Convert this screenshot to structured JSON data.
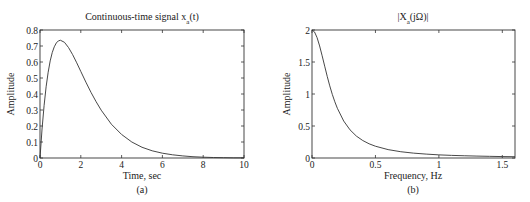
{
  "chart_data": [
    {
      "type": "line",
      "panel": "(a)",
      "title": "Continuous-time signal x_a(t)",
      "title_main": "Continuous-time signal x",
      "title_sub": "a",
      "title_tail": "(t)",
      "xlabel": "Time, sec",
      "ylabel": "Amplitude",
      "caption": "(a)",
      "xlim": [
        0,
        10
      ],
      "ylim": [
        0,
        0.8
      ],
      "xticks": [
        0,
        2,
        4,
        6,
        8,
        10
      ],
      "xtick_labels": [
        "0",
        "2",
        "4",
        "6",
        "8",
        "10"
      ],
      "yticks": [
        0,
        0.1,
        0.2,
        0.3,
        0.4,
        0.5,
        0.6,
        0.7,
        0.8
      ],
      "ytick_labels": [
        "0",
        "0.1",
        "0.2",
        "0.3",
        "0.4",
        "0.5",
        "0.6",
        "0.7",
        "0.8"
      ],
      "grid": false,
      "series": [
        {
          "name": "x_a(t)",
          "x": [
            0,
            0.1,
            0.2,
            0.3,
            0.4,
            0.5,
            0.6,
            0.7,
            0.8,
            0.9,
            1.0,
            1.2,
            1.4,
            1.6,
            1.8,
            2.0,
            2.25,
            2.5,
            2.75,
            3.0,
            3.5,
            4.0,
            4.5,
            5.0,
            5.5,
            6.0,
            6.5,
            7.0,
            7.5,
            8.0,
            8.5,
            9.0,
            9.5,
            10.0
          ],
          "y": [
            0,
            0.181,
            0.327,
            0.445,
            0.536,
            0.607,
            0.659,
            0.695,
            0.719,
            0.732,
            0.736,
            0.723,
            0.69,
            0.646,
            0.595,
            0.541,
            0.474,
            0.41,
            0.352,
            0.299,
            0.211,
            0.147,
            0.1,
            0.067,
            0.045,
            0.03,
            0.02,
            0.013,
            0.008,
            0.005,
            0.003,
            0.002,
            0.001,
            0.001
          ]
        }
      ]
    },
    {
      "type": "line",
      "panel": "(b)",
      "title": "|X_a(jΩ)|",
      "title_main": "|X",
      "title_sub": "a",
      "title_tail": "(jΩ)|",
      "xlabel": "Frequency, Hz",
      "ylabel": "Amplitude",
      "caption": "(b)",
      "xlim": [
        0,
        1.6
      ],
      "ylim": [
        0,
        2
      ],
      "xticks": [
        0,
        0.5,
        1,
        1.5
      ],
      "xtick_labels": [
        "0",
        "0.5",
        "1",
        "1.5"
      ],
      "yticks": [
        0,
        0.5,
        1,
        1.5,
        2
      ],
      "ytick_labels": [
        "0",
        "0.5",
        "1",
        "1.5",
        "2"
      ],
      "grid": false,
      "series": [
        {
          "name": "|X_a(jΩ)|",
          "x": [
            0,
            0.02,
            0.04,
            0.06,
            0.08,
            0.1,
            0.12,
            0.14,
            0.16,
            0.18,
            0.2,
            0.25,
            0.3,
            0.35,
            0.4,
            0.45,
            0.5,
            0.6,
            0.7,
            0.8,
            0.9,
            1.0,
            1.1,
            1.2,
            1.3,
            1.4,
            1.5,
            1.6
          ],
          "y": [
            2.0,
            1.969,
            1.881,
            1.751,
            1.597,
            1.435,
            1.275,
            1.127,
            0.994,
            0.878,
            0.776,
            0.577,
            0.439,
            0.342,
            0.273,
            0.222,
            0.184,
            0.131,
            0.098,
            0.076,
            0.061,
            0.049,
            0.041,
            0.035,
            0.03,
            0.026,
            0.022,
            0.02
          ]
        }
      ]
    }
  ]
}
